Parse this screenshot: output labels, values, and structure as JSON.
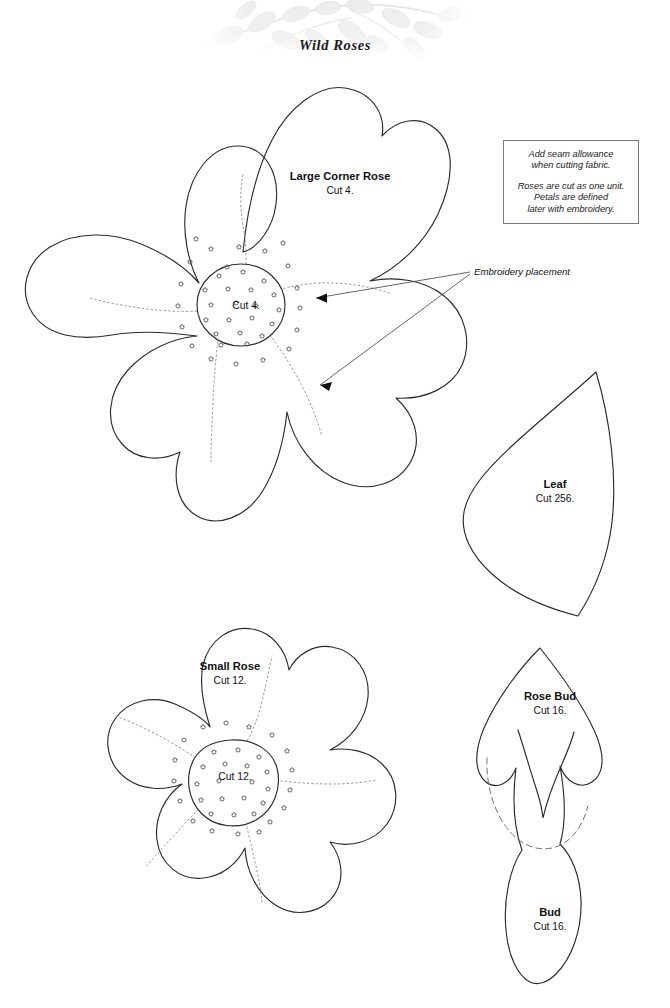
{
  "document": {
    "title": "Wild Roses",
    "sheet_type": "quilt applique pattern template sheet",
    "background_color": "#ffffff",
    "ink_color": "#111111"
  },
  "banner": {
    "name": "leaf-vine-watermark",
    "description": "pale grey leafy vine watermark graphic behind title",
    "color": "#ececec"
  },
  "note_box": {
    "border_color": "#7b7b7b",
    "paragraphs": [
      "Add seam allowance\nwhen cutting fabric.",
      "Roses are cut as one unit.\nPetals are defined\nlater with embroidery."
    ]
  },
  "annotations": {
    "embroidery_placement": "Embroidery placement"
  },
  "pieces": [
    {
      "id": "large-corner-rose",
      "name": "Large Corner Rose",
      "cut": "Cut 4.",
      "center_label": "Cut 4.",
      "petals": 5,
      "has_center_circle": true,
      "has_stamen_dots": true,
      "has_dotted_petal_lines": true
    },
    {
      "id": "leaf",
      "name": "Leaf",
      "cut": "Cut 256.",
      "petals": 0,
      "has_center_circle": false,
      "has_stamen_dots": false,
      "has_dotted_petal_lines": false
    },
    {
      "id": "small-rose",
      "name": "Small Rose",
      "cut": "Cut 12.",
      "center_label": "Cut 12.",
      "petals": 5,
      "has_center_circle": true,
      "has_stamen_dots": true,
      "has_dotted_petal_lines": true
    },
    {
      "id": "rose-bud",
      "name": "Rose Bud",
      "cut": "Cut 16.",
      "petals": 0,
      "has_center_circle": false,
      "has_stamen_dots": false,
      "has_dotted_petal_lines": false
    },
    {
      "id": "bud",
      "name": "Bud",
      "cut": "Cut 16.",
      "petals": 0,
      "has_center_circle": false,
      "has_stamen_dots": false,
      "has_dotted_petal_lines": false
    }
  ]
}
